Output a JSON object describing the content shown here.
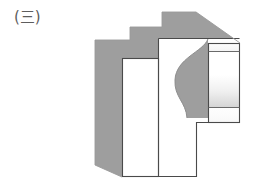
{
  "page": {
    "background_color": "#ffffff",
    "width": 267,
    "height": 187
  },
  "figure": {
    "label": "(三)",
    "label_color": "#5d5d5d",
    "caption_kind": "figure-enumeration-label",
    "title": ""
  },
  "drawing": {
    "type": "engineering-pictorial-view",
    "stroke_color": "#4a4a4a",
    "stroke_width": 1.1,
    "shaded_face_color": "#9e9e9e",
    "shaded_face_color_dark": "#959595",
    "white_face_color": "#ffffff",
    "gradient_face": {
      "from_color": "#ffffff",
      "to_color": "#d8d8d8"
    },
    "faces": [
      {
        "name": "top-and-back-shaded-body",
        "fill": "#9e9e9e",
        "note": "stepped silhouette forming the receding top / back surfaces"
      },
      {
        "name": "front-left-panel",
        "fill": "#ffffff",
        "note": "tall narrow white rectangle, lower step front face"
      },
      {
        "name": "front-main-panel",
        "fill": "#ffffff",
        "note": "large white rectangle, upper step front face"
      },
      {
        "name": "right-side-boss",
        "fill": "gradient",
        "note": "right-hand projecting block with two horizontal division lines"
      },
      {
        "name": "concave-arc-cutout",
        "fill": "#9e9e9e",
        "note": "curved recess cut into the right portion of the main front panel"
      }
    ],
    "geometry": {
      "outer_silhouette": [
        [
          95,
          40
        ],
        [
          130,
          40
        ],
        [
          130,
          27
        ],
        [
          162,
          27
        ],
        [
          162,
          12
        ],
        [
          196,
          12
        ],
        [
          240,
          43
        ],
        [
          240,
          123
        ],
        [
          197,
          123
        ],
        [
          197,
          177
        ],
        [
          122,
          177
        ],
        [
          95,
          165
        ]
      ],
      "left_panel_rect": {
        "x": 122,
        "y": 58,
        "width": 37,
        "height": 119
      },
      "main_panel_rect": {
        "x": 159,
        "y": 38,
        "width": 38,
        "height": 139
      },
      "boss_rect": {
        "x": 208,
        "y": 43,
        "width": 32,
        "height": 80
      },
      "boss_divider_y": [
        51,
        108
      ],
      "arc_cutout": {
        "top": [
          197,
          40
        ],
        "bulge": [
          175,
          78
        ],
        "bottom": [
          186,
          118
        ]
      }
    }
  }
}
